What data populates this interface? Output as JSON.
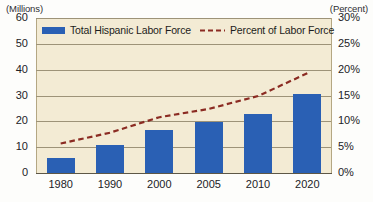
{
  "chart_data": {
    "type": "bar",
    "title": "",
    "subtitle": "",
    "categories": [
      "1980",
      "1990",
      "2000",
      "2005",
      "2010",
      "2020"
    ],
    "xlabel": "",
    "ylabel": "(Millions)",
    "y2label": "(Percent)",
    "ylim": [
      0,
      60
    ],
    "y2lim": [
      0,
      30
    ],
    "yticks": [
      "0",
      "10",
      "20",
      "30",
      "40",
      "50",
      "60"
    ],
    "y2ticks": [
      "0%",
      "5%",
      "10%",
      "15%",
      "20%",
      "25%",
      "30%"
    ],
    "grid": true,
    "legend_position": "top-inside",
    "series": [
      {
        "name": "Total Hispanic Labor Force",
        "type": "bar",
        "axis": "left",
        "units": "millions",
        "color": "#2a60b4",
        "values": [
          6.0,
          10.7,
          16.5,
          19.8,
          22.8,
          30.5
        ]
      },
      {
        "name": "Percent of Labor Force",
        "type": "line",
        "style": "dashed",
        "axis": "right",
        "units": "percent",
        "color": "#8b2b22",
        "values": [
          5.7,
          7.8,
          10.8,
          12.4,
          14.9,
          19.3
        ]
      }
    ]
  },
  "axes": {
    "left_caption": "(Millions)",
    "right_caption": "(Percent)"
  },
  "legend": {
    "items": [
      {
        "label": "Total Hispanic Labor Force",
        "marker": "bar-swatch"
      },
      {
        "label": "Percent of Labor Force",
        "marker": "dashed-line-swatch"
      }
    ]
  },
  "colors": {
    "bar": "#2a60b4",
    "line": "#8b2b22",
    "plot_background": "#f3ebd4",
    "gridline": "#9d9378",
    "axis": "#5d5746",
    "text": "#222226"
  }
}
